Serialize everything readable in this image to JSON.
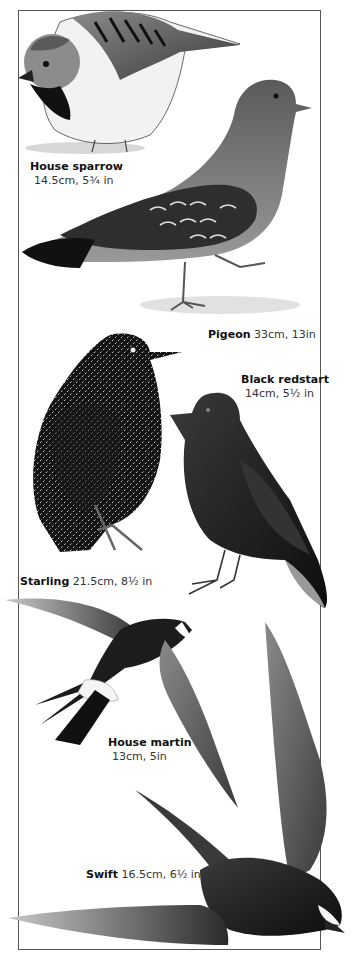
{
  "page": {
    "type": "field-guide-illustration",
    "colors": {
      "ink": "#111111",
      "frame": "#555555",
      "paper": "#ffffff"
    }
  },
  "birds": [
    {
      "id": "house-sparrow",
      "name": "House sparrow",
      "measure": "14.5cm, 5¾ in"
    },
    {
      "id": "pigeon",
      "name": "Pigeon",
      "measure": "33cm, 13in"
    },
    {
      "id": "black-redstart",
      "name": "Black redstart",
      "measure": "14cm, 5½ in"
    },
    {
      "id": "starling",
      "name": "Starling",
      "measure": "21.5cm, 8½ in"
    },
    {
      "id": "house-martin",
      "name": "House martin",
      "measure": "13cm, 5in"
    },
    {
      "id": "swift",
      "name": "Swift",
      "measure": "16.5cm, 6½ in"
    }
  ]
}
